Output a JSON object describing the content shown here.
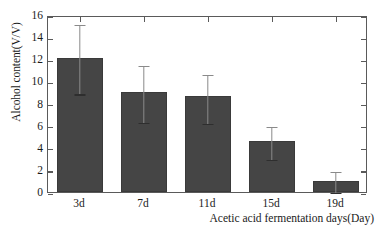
{
  "chart_data": {
    "type": "bar",
    "title": "",
    "subtitle": "",
    "xlabel": "Acetic acid fermentation days(Day)",
    "ylabel": "Alcohol content(V/V)",
    "categories": [
      "3d",
      "7d",
      "11d",
      "15d",
      "19d"
    ],
    "values": [
      12.15,
      9.0,
      8.65,
      4.65,
      1.0
    ],
    "error_upper": [
      3.15,
      2.6,
      2.15,
      1.45,
      1.0
    ],
    "error_lower": [
      3.15,
      2.55,
      2.3,
      1.55,
      0.9
    ],
    "error_upper_values": [
      15.3,
      11.6,
      10.8,
      6.1,
      2.0
    ],
    "error_lower_values": [
      9.0,
      6.45,
      6.35,
      3.1,
      0.1
    ],
    "ylim": [
      0,
      16
    ],
    "ytick_values": [
      0,
      2,
      4,
      6,
      8,
      10,
      12,
      14,
      16
    ],
    "ytick_labels": [
      "0",
      "2",
      "4",
      "6",
      "8",
      "10",
      "12",
      "14",
      "16"
    ],
    "grid": false,
    "legend": null,
    "legend_position": "none",
    "bar_color": "#454545",
    "error_color": "#8a8a8a",
    "axis_color": "#5a5a5a",
    "background_color": "#ffffff",
    "text_color": "#1a1a1a"
  }
}
